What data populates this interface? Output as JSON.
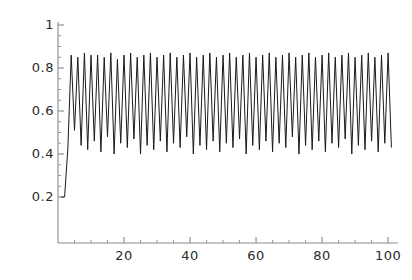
{
  "chart_data": {
    "type": "line",
    "title": "",
    "subtitle": "",
    "xlabel": "",
    "ylabel": "",
    "xlim": [
      0,
      103
    ],
    "ylim": [
      0,
      1
    ],
    "grid": false,
    "legend": null,
    "line_color": "#1a1a1a",
    "axis_color": "#8a8a8a",
    "background_color": "#ffffff",
    "x_ticks": [
      20,
      40,
      60,
      80,
      100
    ],
    "x_tick_labels": [
      "20",
      "40",
      "60",
      "80",
      "100"
    ],
    "x_minor_ticks": [
      5,
      10,
      15,
      25,
      30,
      35,
      45,
      50,
      55,
      65,
      70,
      75,
      85,
      90,
      95
    ],
    "y_ticks": [
      0.2,
      0.4,
      0.6,
      0.8,
      1
    ],
    "y_tick_labels": [
      "0.2",
      "0.4",
      "0.6",
      "0.8",
      "1"
    ],
    "y_minor_ticks": [
      0.25,
      0.3,
      0.35,
      0.45,
      0.5,
      0.55,
      0.65,
      0.7,
      0.75,
      0.85,
      0.9,
      0.95
    ],
    "x": [
      1,
      2,
      3,
      4,
      5,
      6,
      7,
      8,
      9,
      10,
      11,
      12,
      13,
      14,
      15,
      16,
      17,
      18,
      19,
      20,
      21,
      22,
      23,
      24,
      25,
      26,
      27,
      28,
      29,
      30,
      31,
      32,
      33,
      34,
      35,
      36,
      37,
      38,
      39,
      40,
      41,
      42,
      43,
      44,
      45,
      46,
      47,
      48,
      49,
      50,
      51,
      52,
      53,
      54,
      55,
      56,
      57,
      58,
      59,
      60,
      61,
      62,
      63,
      64,
      65,
      66,
      67,
      68,
      69,
      70,
      71,
      72,
      73,
      74,
      75,
      76,
      77,
      78,
      79,
      80,
      81,
      82,
      83,
      84,
      85,
      86,
      87,
      88,
      89,
      90,
      91,
      92,
      93,
      94,
      95,
      96,
      97,
      98,
      99,
      100,
      101
    ],
    "y": [
      0.2,
      0.2,
      0.43,
      0.86,
      0.51,
      0.85,
      0.44,
      0.87,
      0.42,
      0.86,
      0.46,
      0.86,
      0.41,
      0.85,
      0.48,
      0.87,
      0.4,
      0.84,
      0.45,
      0.86,
      0.43,
      0.87,
      0.47,
      0.85,
      0.4,
      0.86,
      0.44,
      0.87,
      0.42,
      0.85,
      0.46,
      0.86,
      0.41,
      0.87,
      0.45,
      0.85,
      0.43,
      0.86,
      0.48,
      0.87,
      0.4,
      0.85,
      0.44,
      0.86,
      0.42,
      0.87,
      0.46,
      0.85,
      0.41,
      0.86,
      0.45,
      0.87,
      0.43,
      0.85,
      0.47,
      0.86,
      0.4,
      0.87,
      0.44,
      0.85,
      0.42,
      0.86,
      0.46,
      0.87,
      0.41,
      0.85,
      0.45,
      0.86,
      0.43,
      0.87,
      0.48,
      0.85,
      0.4,
      0.86,
      0.44,
      0.87,
      0.42,
      0.85,
      0.46,
      0.86,
      0.41,
      0.87,
      0.45,
      0.85,
      0.43,
      0.86,
      0.47,
      0.87,
      0.4,
      0.85,
      0.44,
      0.86,
      0.42,
      0.87,
      0.46,
      0.85,
      0.41,
      0.86,
      0.45,
      0.87,
      0.43
    ],
    "series": [
      {
        "name": "oscillating-sequence",
        "description": "rapidly alternating sequence, rises from ~0.2 then oscillates between ~0.40 and ~0.87"
      }
    ],
    "annotations": []
  }
}
